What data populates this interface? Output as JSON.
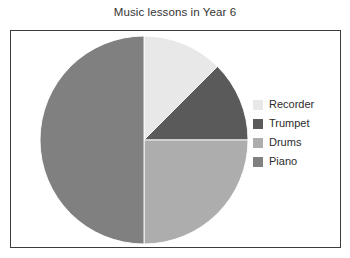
{
  "chart_data": {
    "type": "pie",
    "title": "Music lessons in Year 6",
    "xlabel": "",
    "ylabel": "",
    "legend_position": "right",
    "grid": false,
    "start_angle_deg": 0,
    "direction": "clockwise",
    "categories": [
      "Recorder",
      "Trumpet",
      "Drums",
      "Piano"
    ],
    "values": [
      12.5,
      12.5,
      25,
      50
    ],
    "units": "percent",
    "slices": [
      {
        "label": "Recorder",
        "value": 12.5,
        "color": "#e8e8e8",
        "start_angle_deg": 0,
        "end_angle_deg": 45
      },
      {
        "label": "Trumpet",
        "value": 12.5,
        "color": "#5a5a5a",
        "start_angle_deg": 45,
        "end_angle_deg": 90
      },
      {
        "label": "Drums",
        "value": 25,
        "color": "#adadad",
        "start_angle_deg": 90,
        "end_angle_deg": 180
      },
      {
        "label": "Piano",
        "value": 50,
        "color": "#808080",
        "start_angle_deg": 180,
        "end_angle_deg": 360
      }
    ]
  },
  "legend": {
    "items": [
      {
        "label": "Recorder",
        "color": "#e8e8e8"
      },
      {
        "label": "Trumpet",
        "color": "#5a5a5a"
      },
      {
        "label": "Drums",
        "color": "#adadad"
      },
      {
        "label": "Piano",
        "color": "#808080"
      }
    ]
  },
  "style": {
    "background": "#ffffff",
    "frame_border": "#3c3c3c",
    "title_color": "#333333",
    "label_color": "#2b2b2b",
    "slice_edge": "#ffffff"
  }
}
